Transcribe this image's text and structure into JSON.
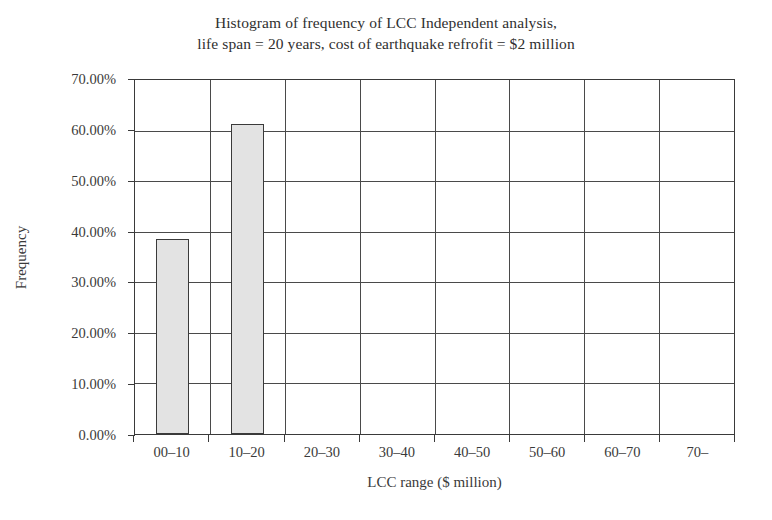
{
  "chart_data": {
    "type": "bar",
    "title": "Histogram of frequency of LCC Independent analysis, life span = 20 years, cost of earthquake refrofit = $2 million",
    "title_lines": [
      "Histogram of frequency of LCC Independent analysis,",
      "life span = 20 years, cost of earthquake refrofit = $2 million"
    ],
    "xlabel": "LCC range ($ million)",
    "ylabel": "Frequency",
    "categories": [
      "00–10",
      "10–20",
      "20–30",
      "30–40",
      "40–50",
      "50–60",
      "60–70",
      "70–"
    ],
    "values": [
      38.5,
      61.3,
      0,
      0,
      0,
      0,
      0,
      0
    ],
    "value_labels": [
      "38.50%",
      "61.30%",
      "0.00%",
      "0.00%",
      "0.00%",
      "0.00%",
      "0.00%",
      "0.00%"
    ],
    "ylim": [
      0,
      70
    ],
    "ytick_values": [
      0,
      10,
      20,
      30,
      40,
      50,
      60,
      70
    ],
    "ytick_labels": [
      "0.00%",
      "10.00%",
      "20.00%",
      "30.00%",
      "40.00%",
      "50.00%",
      "60.00%",
      "70.00%"
    ],
    "grid": "both",
    "legend": "none",
    "bar_fill_color": "#e3e3e3",
    "bar_edge_color": "#3a3a3a",
    "axis_color": "#3a3a3a",
    "grid_color": "#4a4a4a",
    "background_color": "#ffffff"
  }
}
